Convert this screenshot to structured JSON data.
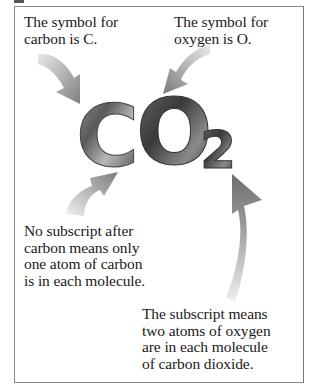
{
  "figure": {
    "formula": {
      "element_1": "C",
      "element_2": "O",
      "subscript": "2"
    },
    "captions": {
      "carbon_symbol": "The symbol for\ncarbon is C.",
      "oxygen_symbol": "The symbol for\noxygen is O.",
      "no_subscript": "No subscript after\ncarbon means only\none atom of carbon\nis in each molecule.",
      "subscript_meaning": "The subscript means\ntwo atoms of oxygen\nare in each molecule\nof carbon dioxide."
    },
    "arrows": [
      {
        "name": "arrow-to-carbon",
        "points_to": "C"
      },
      {
        "name": "arrow-to-oxygen",
        "points_to": "O"
      },
      {
        "name": "arrow-to-carbon-subscript-position",
        "points_to": "after C"
      },
      {
        "name": "arrow-to-subscript",
        "points_to": "2"
      }
    ],
    "colors": {
      "frame": "#8a8a8a",
      "text": "#1a1a1a",
      "letter_dark": "#3a3a3a",
      "letter_light": "#b5b5b5",
      "arrow_dark": "#7a7a7a",
      "arrow_light": "#e6e6e6"
    }
  }
}
